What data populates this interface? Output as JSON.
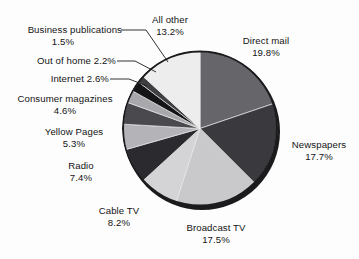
{
  "chart_data": {
    "type": "pie",
    "title": "",
    "subtitle": "",
    "xlabel": "",
    "ylabel": "",
    "legend_position": "callout-labels",
    "grid": false,
    "units": "percent",
    "total": 100,
    "categories": [
      "Direct mail",
      "Newspapers",
      "Broadcast TV",
      "Cable TV",
      "Radio",
      "Yellow Pages",
      "Consumer magazines",
      "Internet",
      "Out of home",
      "Business publications",
      "All other"
    ],
    "values": [
      19.8,
      17.7,
      17.5,
      8.2,
      7.4,
      5.3,
      4.6,
      2.6,
      2.2,
      1.5,
      13.2
    ],
    "colors": [
      "#66666a",
      "#3a3a3e",
      "#c9c9cc",
      "#d4d4d7",
      "#2b2b2f",
      "#b4b4b8",
      "#4a4a4e",
      "#a8a8ac",
      "#151518",
      "#3f3f43",
      "#ededee"
    ],
    "slices": [
      {
        "label": "Direct mail",
        "value": 19.8,
        "value_text": "19.8%",
        "color": "#66666a"
      },
      {
        "label": "Newspapers",
        "value": 17.7,
        "value_text": "17.7%",
        "color": "#3a3a3e"
      },
      {
        "label": "Broadcast TV",
        "value": 17.5,
        "value_text": "17.5%",
        "color": "#c9c9cc"
      },
      {
        "label": "Cable TV",
        "value": 8.2,
        "value_text": "8.2%",
        "color": "#d4d4d7"
      },
      {
        "label": "Radio",
        "value": 7.4,
        "value_text": "7.4%",
        "color": "#2b2b2f"
      },
      {
        "label": "Yellow Pages",
        "value": 5.3,
        "value_text": "5.3%",
        "color": "#b4b4b8"
      },
      {
        "label": "Consumer magazines",
        "value": 4.6,
        "value_text": "4.6%",
        "color": "#4a4a4e"
      },
      {
        "label": "Internet",
        "value": 2.6,
        "value_text": "2.6%",
        "color": "#a8a8ac"
      },
      {
        "label": "Out of home",
        "value": 2.2,
        "value_text": "2.2%",
        "color": "#151518"
      },
      {
        "label": "Business publications",
        "value": 1.5,
        "value_text": "1.5%",
        "color": "#3f3f43"
      },
      {
        "label": "All other",
        "value": 13.2,
        "value_text": "13.2%",
        "color": "#ededee"
      }
    ]
  },
  "callouts": {
    "business_publications": {
      "name": "Business publications",
      "value": "1.5%"
    },
    "out_of_home": {
      "name": "Out of home 2.2%",
      "value": ""
    },
    "internet": {
      "name": "Internet 2.6%",
      "value": ""
    },
    "consumer_magazines": {
      "name": "Consumer magazines",
      "value": "4.6%"
    },
    "yellow_pages": {
      "name": "Yellow Pages",
      "value": "5.3%"
    },
    "radio": {
      "name": "Radio",
      "value": "7.4%"
    },
    "cable_tv": {
      "name": "Cable TV",
      "value": "8.2%"
    },
    "broadcast_tv": {
      "name": "Broadcast TV",
      "value": "17.5%"
    },
    "newspapers": {
      "name": "Newspapers",
      "value": "17.7%"
    },
    "direct_mail": {
      "name": "Direct mail",
      "value": "19.8%"
    },
    "all_other": {
      "name": "All other",
      "value": "13.2%"
    }
  }
}
